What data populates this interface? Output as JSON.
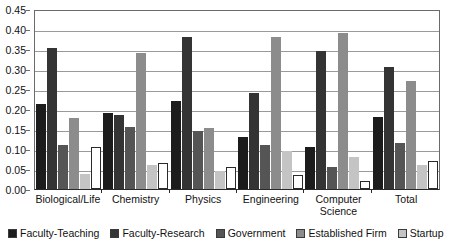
{
  "chart_data": {
    "type": "bar",
    "title": "",
    "xlabel": "",
    "ylabel": "",
    "ylim": [
      0,
      0.45
    ],
    "ytick_labels": [
      "0.00",
      "0.05",
      "0.10",
      "0.15",
      "0.20",
      "0.25",
      "0.30",
      "0.35",
      "0.40",
      "0.45"
    ],
    "ytick_values": [
      0,
      0.05,
      0.1,
      0.15,
      0.2,
      0.25,
      0.3,
      0.35,
      0.4,
      0.45
    ],
    "grid": true,
    "legend_position": "bottom",
    "categories": [
      "Biological/Life",
      "Chemistry",
      "Physics",
      "Engineering",
      "Computer Science",
      "Total"
    ],
    "series": [
      {
        "name": "Faculty-Teaching",
        "color": "#1c1c1c",
        "values": [
          0.212,
          0.19,
          0.221,
          0.13,
          0.105,
          0.181
        ]
      },
      {
        "name": "Faculty-Research",
        "color": "#343434",
        "values": [
          0.352,
          0.185,
          0.381,
          0.24,
          0.345,
          0.306
        ]
      },
      {
        "name": "Government",
        "color": "#555555",
        "values": [
          0.109,
          0.154,
          0.145,
          0.11,
          0.055,
          0.115
        ]
      },
      {
        "name": "Established Firm",
        "color": "#8c8c8c",
        "values": [
          0.178,
          0.341,
          0.152,
          0.381,
          0.391,
          0.271
        ]
      },
      {
        "name": "Startup",
        "color": "#c4c4c4",
        "values": [
          0.038,
          0.06,
          0.045,
          0.095,
          0.08,
          0.06
        ]
      },
      {
        "name": "Other",
        "color": "#ffffff",
        "values": [
          0.106,
          0.065,
          0.056,
          0.035,
          0.02,
          0.071
        ]
      }
    ]
  }
}
